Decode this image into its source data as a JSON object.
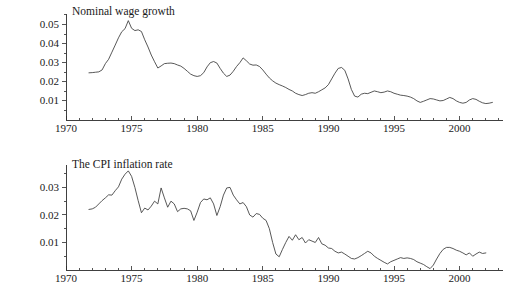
{
  "figure": {
    "background": "#ffffff",
    "line_color": "#3a3a3a",
    "axis_color": "#2b2b2b",
    "caption": ""
  },
  "chart_data": [
    {
      "type": "line",
      "title": "Nominal wage growth",
      "xlabel": "",
      "ylabel": "",
      "xlim": [
        1970,
        2003.2
      ],
      "ylim": [
        0,
        0.056
      ],
      "xticks": [
        1970,
        1975,
        1980,
        1985,
        1990,
        1995,
        2000
      ],
      "xticklabels": [
        "1970",
        "1975",
        "1980",
        "1985",
        "1990",
        "1995",
        "2000"
      ],
      "yticks": [
        0.01,
        0.02,
        0.03,
        0.04,
        0.05
      ],
      "yticklabels": [
        "0.01",
        "0.02",
        "0.03",
        "0.04",
        "0.05"
      ],
      "grid": false,
      "legend": "none",
      "x": [
        1971.75,
        1972.0,
        1972.25,
        1972.5,
        1972.75,
        1973.0,
        1973.25,
        1973.5,
        1973.75,
        1974.0,
        1974.25,
        1974.5,
        1974.75,
        1975.0,
        1975.25,
        1975.5,
        1975.75,
        1976.0,
        1976.25,
        1976.5,
        1976.75,
        1977.0,
        1977.25,
        1977.5,
        1977.75,
        1978.0,
        1978.25,
        1978.5,
        1978.75,
        1979.0,
        1979.25,
        1979.5,
        1979.75,
        1980.0,
        1980.25,
        1980.5,
        1980.75,
        1981.0,
        1981.25,
        1981.5,
        1981.75,
        1982.0,
        1982.25,
        1982.5,
        1982.75,
        1983.0,
        1983.25,
        1983.5,
        1983.75,
        1984.0,
        1984.25,
        1984.5,
        1984.75,
        1985.0,
        1985.25,
        1985.5,
        1985.75,
        1986.0,
        1986.25,
        1986.5,
        1986.75,
        1987.0,
        1987.25,
        1987.5,
        1987.75,
        1988.0,
        1988.25,
        1988.5,
        1988.75,
        1989.0,
        1989.25,
        1989.5,
        1989.75,
        1990.0,
        1990.25,
        1990.5,
        1990.75,
        1991.0,
        1991.25,
        1991.5,
        1991.75,
        1992.0,
        1992.25,
        1992.5,
        1992.75,
        1993.0,
        1993.25,
        1993.5,
        1993.75,
        1994.0,
        1994.25,
        1994.5,
        1994.75,
        1995.0,
        1995.25,
        1995.5,
        1995.75,
        1996.0,
        1996.25,
        1996.5,
        1996.75,
        1997.0,
        1997.25,
        1997.5,
        1997.75,
        1998.0,
        1998.25,
        1998.5,
        1998.75,
        1999.0,
        1999.25,
        1999.5,
        1999.75,
        2000.0,
        2000.25,
        2000.5,
        2000.75,
        2001.0,
        2001.25,
        2001.5,
        2001.75,
        2002.0,
        2002.25,
        2002.5
      ],
      "y": [
        0.0247,
        0.0248,
        0.025,
        0.0252,
        0.0262,
        0.0295,
        0.0318,
        0.0355,
        0.0392,
        0.043,
        0.0462,
        0.0478,
        0.052,
        0.048,
        0.0468,
        0.0472,
        0.0463,
        0.042,
        0.0382,
        0.034,
        0.0305,
        0.0272,
        0.0283,
        0.0295,
        0.0297,
        0.0298,
        0.0295,
        0.0288,
        0.0282,
        0.027,
        0.0255,
        0.024,
        0.0232,
        0.0228,
        0.0232,
        0.0248,
        0.0278,
        0.03,
        0.0306,
        0.0298,
        0.027,
        0.0245,
        0.0228,
        0.0235,
        0.0255,
        0.028,
        0.03,
        0.0325,
        0.031,
        0.0293,
        0.0287,
        0.0288,
        0.028,
        0.0262,
        0.024,
        0.022,
        0.0205,
        0.0193,
        0.0185,
        0.0178,
        0.017,
        0.016,
        0.0152,
        0.014,
        0.0133,
        0.0128,
        0.0133,
        0.014,
        0.0143,
        0.014,
        0.0148,
        0.0158,
        0.0168,
        0.0185,
        0.0215,
        0.0245,
        0.027,
        0.0275,
        0.026,
        0.0215,
        0.016,
        0.0125,
        0.012,
        0.0135,
        0.014,
        0.0138,
        0.0145,
        0.0152,
        0.0148,
        0.0143,
        0.0146,
        0.0152,
        0.0148,
        0.014,
        0.0135,
        0.013,
        0.0128,
        0.0125,
        0.012,
        0.0112,
        0.01,
        0.0092,
        0.0098,
        0.0105,
        0.0112,
        0.011,
        0.0105,
        0.01,
        0.0102,
        0.011,
        0.0118,
        0.0112,
        0.01,
        0.0092,
        0.0088,
        0.0092,
        0.0105,
        0.0112,
        0.0108,
        0.0098,
        0.009,
        0.0086,
        0.0088,
        0.0092
      ]
    },
    {
      "type": "line",
      "title": "The CPI inflation rate",
      "xlabel": "",
      "ylabel": "",
      "xlim": [
        1970,
        2003.2
      ],
      "ylim": [
        0,
        0.0385
      ],
      "xticks": [
        1970,
        1975,
        1980,
        1985,
        1990,
        1995,
        2000
      ],
      "xticklabels": [
        "1970",
        "1975",
        "1980",
        "1985",
        "1990",
        "1995",
        "2000"
      ],
      "yticks": [
        0.01,
        0.02,
        0.03
      ],
      "yticklabels": [
        "0.01",
        "0.02",
        "0.03"
      ],
      "grid": false,
      "legend": "none",
      "x": [
        1971.75,
        1972.0,
        1972.25,
        1972.5,
        1972.75,
        1973.0,
        1973.25,
        1973.5,
        1973.75,
        1974.0,
        1974.25,
        1974.5,
        1974.75,
        1975.0,
        1975.25,
        1975.5,
        1975.75,
        1976.0,
        1976.25,
        1976.5,
        1976.75,
        1977.0,
        1977.25,
        1977.5,
        1977.75,
        1978.0,
        1978.25,
        1978.5,
        1978.75,
        1979.0,
        1979.25,
        1979.5,
        1979.75,
        1980.0,
        1980.25,
        1980.5,
        1980.75,
        1981.0,
        1981.25,
        1981.5,
        1981.75,
        1982.0,
        1982.25,
        1982.5,
        1982.75,
        1983.0,
        1983.25,
        1983.5,
        1983.75,
        1984.0,
        1984.25,
        1984.5,
        1984.75,
        1985.0,
        1985.25,
        1985.5,
        1985.75,
        1986.0,
        1986.25,
        1986.5,
        1986.75,
        1987.0,
        1987.25,
        1987.5,
        1987.75,
        1988.0,
        1988.25,
        1988.5,
        1988.75,
        1989.0,
        1989.25,
        1989.5,
        1989.75,
        1990.0,
        1990.25,
        1990.5,
        1990.75,
        1991.0,
        1991.25,
        1991.5,
        1991.75,
        1992.0,
        1992.25,
        1992.5,
        1992.75,
        1993.0,
        1993.25,
        1993.5,
        1993.75,
        1994.0,
        1994.25,
        1994.5,
        1994.75,
        1995.0,
        1995.25,
        1995.5,
        1995.75,
        1996.0,
        1996.25,
        1996.5,
        1996.75,
        1997.0,
        1997.25,
        1997.5,
        1997.75,
        1998.0,
        1998.25,
        1998.5,
        1998.75,
        1999.0,
        1999.25,
        1999.5,
        1999.75,
        2000.0,
        2000.25,
        2000.5,
        2000.75,
        2001.0,
        2001.25,
        2001.5,
        2001.75,
        2002.0,
        2002.25,
        2002.5
      ],
      "y": [
        0.022,
        0.0222,
        0.0228,
        0.024,
        0.0252,
        0.0262,
        0.0273,
        0.0272,
        0.0288,
        0.0302,
        0.033,
        0.0348,
        0.036,
        0.034,
        0.03,
        0.0252,
        0.0208,
        0.0225,
        0.0218,
        0.0232,
        0.025,
        0.024,
        0.0298,
        0.0262,
        0.0228,
        0.025,
        0.024,
        0.0212,
        0.0222,
        0.0224,
        0.0222,
        0.0215,
        0.018,
        0.021,
        0.0245,
        0.0258,
        0.0255,
        0.0262,
        0.024,
        0.0198,
        0.023,
        0.0272,
        0.0298,
        0.03,
        0.0272,
        0.0255,
        0.024,
        0.0245,
        0.023,
        0.02,
        0.0192,
        0.0205,
        0.0202,
        0.0188,
        0.018,
        0.015,
        0.01,
        0.0058,
        0.0048,
        0.0075,
        0.01,
        0.0122,
        0.0108,
        0.0128,
        0.011,
        0.0118,
        0.0098,
        0.011,
        0.0105,
        0.01,
        0.0118,
        0.0095,
        0.009,
        0.008,
        0.0078,
        0.0068,
        0.0062,
        0.0065,
        0.0058,
        0.005,
        0.0042,
        0.004,
        0.0045,
        0.0052,
        0.006,
        0.0068,
        0.0062,
        0.005,
        0.0042,
        0.0035,
        0.0028,
        0.0022,
        0.003,
        0.0035,
        0.004,
        0.0045,
        0.0042,
        0.0044,
        0.0042,
        0.0038,
        0.003,
        0.0025,
        0.002,
        0.0012,
        0.0005,
        0.0018,
        0.004,
        0.006,
        0.0075,
        0.0082,
        0.0082,
        0.0078,
        0.0072,
        0.0068,
        0.0062,
        0.0055,
        0.0062,
        0.005,
        0.0058,
        0.0065,
        0.006,
        0.0062
      ]
    }
  ]
}
